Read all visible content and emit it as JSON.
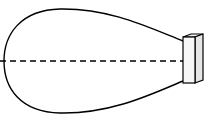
{
  "diagram": {
    "type": "radiation-pattern",
    "elements": [
      {
        "name": "lobe",
        "shape": "teardrop",
        "description": "directional radiation lobe"
      },
      {
        "name": "axis",
        "shape": "dashed-line",
        "description": "main beam axis"
      },
      {
        "name": "emitter",
        "shape": "3d-box",
        "description": "source / transducer"
      }
    ],
    "colors": {
      "stroke": "#000000",
      "background": "#ffffff",
      "emitter_fill": "#f2f2f2"
    }
  }
}
